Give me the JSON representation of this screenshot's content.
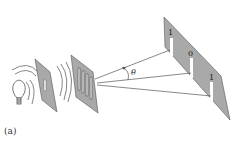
{
  "figure": {
    "caption": "(a)",
    "angle_label": "θ",
    "screen_labels": [
      "1",
      "0",
      "1"
    ],
    "colors": {
      "plate_fill": "#a9a9a9",
      "plate_stroke": "#555555",
      "line": "#555555",
      "slit": "#ffffff",
      "background": "#ffffff"
    },
    "components": [
      "light-bulb",
      "single-slit-plate",
      "diffraction-grating",
      "detection-screen"
    ]
  }
}
